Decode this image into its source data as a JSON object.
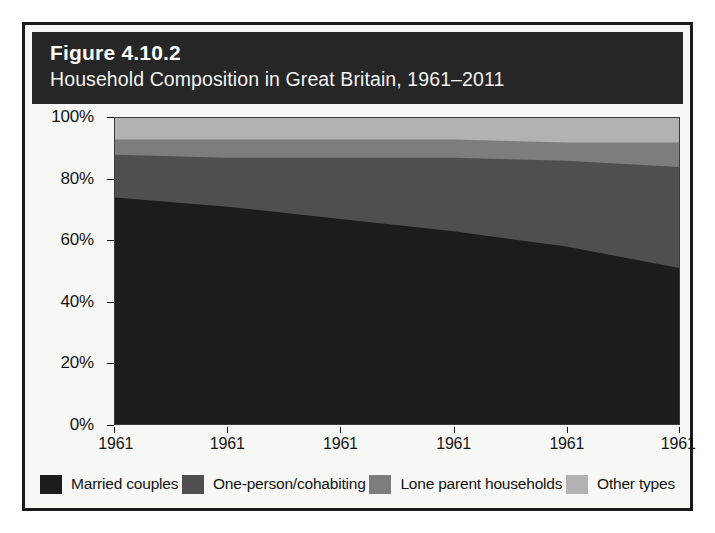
{
  "figure": {
    "number": "Figure 4.10.2",
    "subtitle": "Household Composition in Great Britain, 1961–2011"
  },
  "colors": {
    "banner_background": "#262626",
    "card_border": "#1a1a1a",
    "page_background": "#f7f7f5",
    "married_couples": "#1c1c1c",
    "one_person_cohabiting": "#4f4f4f",
    "lone_parent_households": "#7d7d7d",
    "other_types": "#b2b2b2"
  },
  "legend": {
    "position": "bottom",
    "items": [
      {
        "label": "Married couples",
        "color": "#1c1c1c",
        "swatch_name": "legend-swatch-married-couples"
      },
      {
        "label": "One-person/cohabiting",
        "color": "#4f4f4f",
        "swatch_name": "legend-swatch-one-person-cohabiting"
      },
      {
        "label": "Lone parent households",
        "color": "#7d7d7d",
        "swatch_name": "legend-swatch-lone-parent-households"
      },
      {
        "label": "Other types",
        "color": "#b2b2b2",
        "swatch_name": "legend-swatch-other-types"
      }
    ]
  },
  "chart_data": {
    "type": "area",
    "stacked": true,
    "stack_total": 100,
    "title": "Household Composition in Great Britain, 1961–2011",
    "xlabel": "",
    "ylabel": "",
    "ylim": [
      0,
      100
    ],
    "xlim": [
      0,
      5
    ],
    "grid": false,
    "x": [
      0,
      1,
      2,
      3,
      4,
      5
    ],
    "categories": [
      "1961",
      "1961",
      "1961",
      "1961",
      "1961",
      "1961"
    ],
    "x_tick_labels": [
      "1961",
      "1961",
      "1961",
      "1961",
      "1961",
      "1961"
    ],
    "y_tick_labels": [
      "0%",
      "20%",
      "40%",
      "60%",
      "80%",
      "100%"
    ],
    "y_ticks": [
      0,
      20,
      40,
      60,
      80,
      100
    ],
    "series": [
      {
        "name": "Married couples",
        "color": "#1c1c1c",
        "values": [
          74,
          71,
          67,
          63,
          58,
          51
        ]
      },
      {
        "name": "One-person/cohabiting",
        "color": "#4f4f4f",
        "values": [
          14,
          16,
          20,
          24,
          28,
          33
        ]
      },
      {
        "name": "Lone parent households",
        "color": "#7d7d7d",
        "values": [
          5,
          6,
          6,
          6,
          6,
          8
        ]
      },
      {
        "name": "Other types",
        "color": "#b2b2b2",
        "values": [
          7,
          7,
          7,
          7,
          8,
          8
        ]
      }
    ],
    "cumulative_tops": {
      "married_couples": [
        74,
        71,
        67,
        63,
        58,
        51
      ],
      "plus_one_person": [
        88,
        87,
        87,
        87,
        86,
        84
      ],
      "plus_lone_parent": [
        93,
        93,
        93,
        93,
        92,
        92
      ],
      "plus_other": [
        100,
        100,
        100,
        100,
        100,
        100
      ]
    }
  }
}
